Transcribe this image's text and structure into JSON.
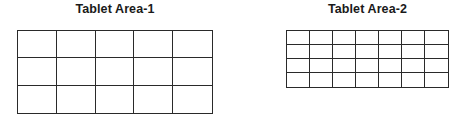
{
  "areas": [
    {
      "title": "Tablet Area-1",
      "columns": 5,
      "rows": 3
    },
    {
      "title": "Tablet Area-2",
      "columns": 7,
      "rows": 4
    }
  ],
  "colors": {
    "line": "#2a2a2a",
    "background": "#ffffff"
  }
}
